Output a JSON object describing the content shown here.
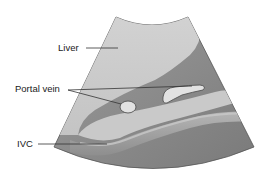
{
  "diagram": {
    "type": "ultrasound-schematic",
    "labels": {
      "liver": "Liver",
      "portal_vein": "Portal vein",
      "ivc": "IVC"
    },
    "colors": {
      "fan_background": "#8a8a8a",
      "liver_region": "#cfcfcf",
      "vessel_fill": "#e6e6e6",
      "ivc_band": "#9a9a9a",
      "outline": "#4a4a4a",
      "leader_line": "#333333"
    }
  }
}
